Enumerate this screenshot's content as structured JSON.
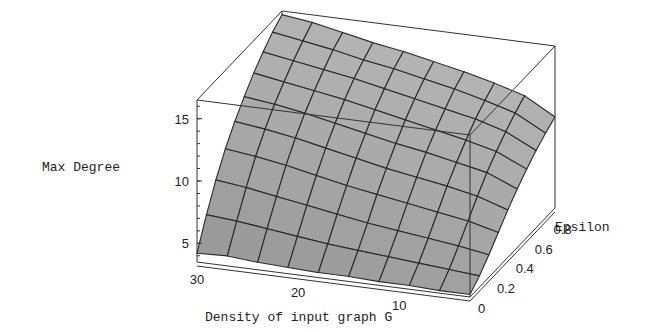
{
  "chart_data": {
    "type": "surface3d",
    "title": "",
    "xlabel": "Density of input graph G",
    "ylabel": "Epsilon",
    "zlabel": "Max Degree",
    "x_ticks": [
      "30",
      "20",
      "10"
    ],
    "y_ticks": [
      "0",
      "0.2",
      "0.4",
      "0.6",
      "0.8"
    ],
    "z_ticks": [
      "5",
      "10",
      "15"
    ],
    "x_range": [
      3,
      30
    ],
    "y_range": [
      0,
      0.9
    ],
    "z_range": [
      3.5,
      16.5
    ],
    "x": [
      30,
      27,
      24,
      21,
      18,
      15,
      12,
      9,
      6,
      3
    ],
    "y": [
      0.0,
      0.1,
      0.2,
      0.3,
      0.4,
      0.5,
      0.6,
      0.7,
      0.8,
      0.9
    ],
    "z": [
      [
        4.2,
        4.3,
        4.1,
        4.0,
        3.9,
        3.9,
        3.8,
        3.8,
        3.7,
        3.7
      ],
      [
        6.5,
        6.3,
        6.0,
        5.7,
        5.4,
        5.2,
        5.0,
        4.8,
        4.6,
        4.4
      ],
      [
        8.5,
        8.2,
        7.8,
        7.4,
        7.0,
        6.6,
        6.3,
        6.0,
        5.7,
        5.3
      ],
      [
        10.2,
        9.9,
        9.5,
        9.0,
        8.5,
        8.1,
        7.7,
        7.3,
        6.9,
        6.3
      ],
      [
        11.6,
        11.3,
        10.9,
        10.4,
        9.9,
        9.4,
        9.0,
        8.6,
        8.1,
        7.3
      ],
      [
        12.8,
        12.5,
        12.1,
        11.6,
        11.1,
        10.6,
        10.2,
        9.7,
        9.2,
        8.2
      ],
      [
        13.9,
        13.5,
        13.1,
        12.7,
        12.2,
        11.7,
        11.2,
        10.7,
        10.1,
        9.0
      ],
      [
        14.8,
        14.4,
        14.0,
        13.6,
        13.1,
        12.6,
        12.1,
        11.6,
        10.9,
        9.7
      ],
      [
        15.6,
        15.2,
        14.8,
        14.3,
        13.9,
        13.4,
        12.9,
        12.3,
        11.6,
        10.3
      ],
      [
        16.2,
        15.9,
        15.4,
        14.9,
        14.5,
        14.0,
        13.5,
        12.9,
        12.2,
        10.8
      ]
    ],
    "surface_color": "#9a9a9a",
    "mesh_color": "#2a2a2a",
    "grid": false,
    "box": true
  }
}
